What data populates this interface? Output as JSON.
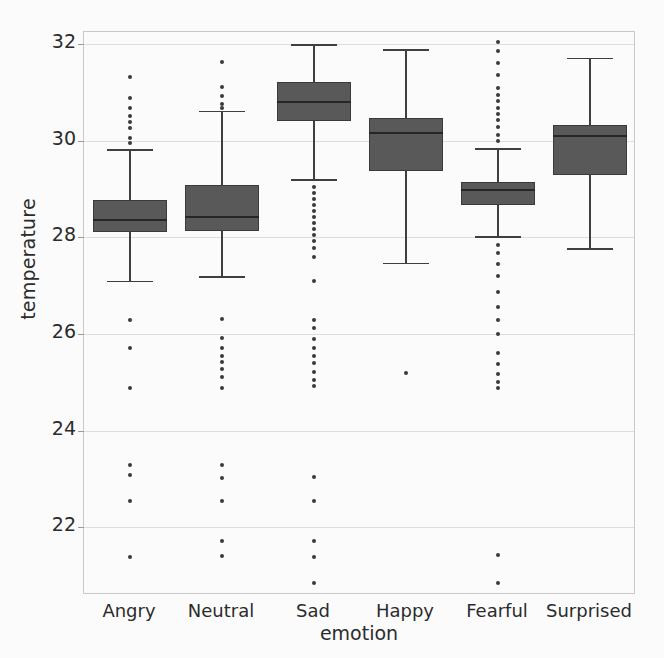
{
  "chart_data": {
    "type": "box",
    "title": "",
    "xlabel": "emotion",
    "ylabel": "temperature",
    "categories": [
      "Angry",
      "Neutral",
      "Sad",
      "Happy",
      "Fearful",
      "Surprised"
    ],
    "ylim": [
      20.6,
      32.25
    ],
    "yticks": [
      22,
      24,
      26,
      28,
      30,
      32
    ],
    "ytick_labels": [
      "22",
      "24",
      "26",
      "28",
      "30",
      "32"
    ],
    "grid": true,
    "legend": null,
    "box_color": "#595959",
    "line_color": "#3a3a3a",
    "grid_color": "#dedede",
    "boxes": [
      {
        "label": "Angry",
        "whisker_low": 27.1,
        "q1": 28.12,
        "median": 28.38,
        "q3": 28.78,
        "whisker_high": 29.82,
        "fliers": [
          31.32,
          30.88,
          30.68,
          30.52,
          30.38,
          30.26,
          30.05,
          29.95,
          26.3,
          25.72,
          24.88,
          23.3,
          23.08,
          22.55,
          21.38
        ]
      },
      {
        "label": "Neutral",
        "whisker_low": 27.2,
        "q1": 28.14,
        "median": 28.44,
        "q3": 29.08,
        "whisker_high": 30.62,
        "fliers": [
          31.62,
          31.12,
          30.92,
          30.75,
          30.68,
          26.32,
          25.92,
          25.72,
          25.55,
          25.42,
          25.28,
          25.12,
          24.88,
          23.3,
          23.02,
          22.55,
          21.72,
          21.4
        ]
      },
      {
        "label": "Sad",
        "whisker_low": 29.2,
        "q1": 30.4,
        "median": 30.82,
        "q3": 31.22,
        "whisker_high": 32.0,
        "fliers": [
          29.05,
          28.92,
          28.8,
          28.68,
          28.55,
          28.42,
          28.3,
          28.18,
          28.05,
          27.92,
          27.78,
          27.6,
          27.1,
          26.3,
          26.12,
          25.9,
          25.72,
          25.55,
          25.4,
          25.22,
          25.05,
          24.92,
          23.05,
          22.55,
          21.72,
          21.38,
          20.85
        ]
      },
      {
        "label": "Happy",
        "whisker_low": 27.48,
        "q1": 29.38,
        "median": 30.18,
        "q3": 30.48,
        "whisker_high": 31.9,
        "fliers": [
          25.2
        ]
      },
      {
        "label": "Fearful",
        "whisker_low": 28.02,
        "q1": 28.68,
        "median": 29.0,
        "q3": 29.15,
        "whisker_high": 29.85,
        "fliers": [
          32.05,
          31.85,
          31.6,
          31.35,
          31.1,
          30.95,
          30.82,
          30.68,
          30.55,
          30.42,
          30.28,
          30.12,
          30.0,
          27.85,
          27.68,
          27.45,
          27.2,
          26.88,
          26.55,
          26.3,
          26.0,
          25.6,
          25.38,
          25.18,
          25.0,
          24.88,
          21.42,
          20.85
        ]
      },
      {
        "label": "Surprised",
        "whisker_low": 27.78,
        "q1": 29.3,
        "median": 30.12,
        "q3": 30.32,
        "whisker_high": 31.72,
        "fliers": []
      }
    ]
  }
}
